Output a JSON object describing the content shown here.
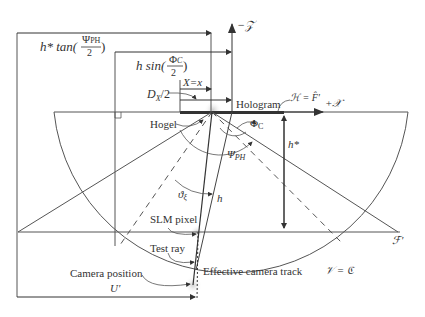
{
  "labels": {
    "neg_z_axis": "−𝒵",
    "pos_x_axis": "+𝒳",
    "h_tan": "h* tan(",
    "psi_ph": "Ψ",
    "psi_sub": "PH",
    "two": "2",
    "close_paren": ")",
    "h_sin": "h sin(",
    "phi_c": "Φ",
    "phi_sub": "C",
    "x_eq": "X=x",
    "dx_half": "D",
    "dx_sub": "X",
    "dx_tail": "/2",
    "hogel": "Hogel",
    "hologram": "Hologram",
    "h_eq_f": "ℋ = F̂′",
    "phi_c_angle": "Φ",
    "phi_c_angle_sub": "C",
    "h_star": "h*",
    "psi_angle": "Ψ",
    "psi_angle_sub": "PH",
    "theta_xi": "ϑ",
    "theta_sub": "ξ",
    "h": "h",
    "slm_pixel": "SLM pixel",
    "test_ray": "Test ray",
    "camera_position": "Camera position",
    "u_prime": "U′",
    "effective_camera_track": "Effective camera track",
    "f_prime": "ℱ′",
    "v_eq_c": "𝒱 = ℭ"
  },
  "colors": {
    "line": "#555555",
    "hologram_bar": "#333333",
    "highlight": "#dddddd"
  }
}
